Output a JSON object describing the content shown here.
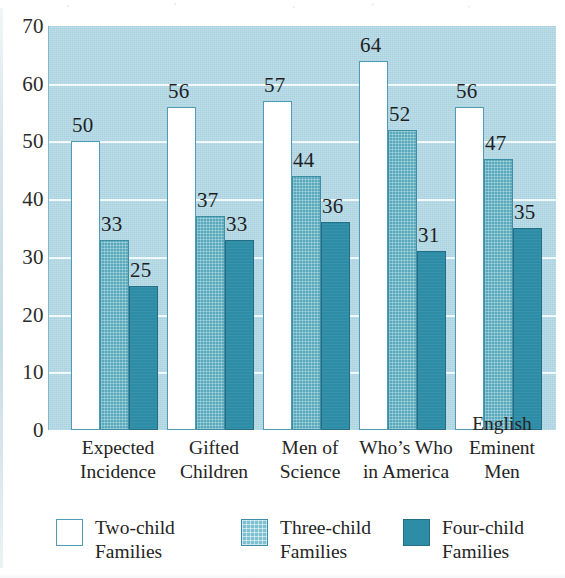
{
  "chart_data": {
    "type": "bar",
    "title": "",
    "subtitle": "",
    "xlabel": "",
    "ylabel": "",
    "ylim": [
      0,
      70
    ],
    "yticks": [
      0,
      10,
      20,
      30,
      40,
      50,
      60,
      70
    ],
    "grid": true,
    "legend_position": "bottom",
    "categories": [
      "Expected\nIncidence",
      "Gifted\nChildren",
      "Men of\nScience",
      "Who's Who\nin America",
      "English\nEminent\nMen"
    ],
    "category_lines": [
      [
        "Expected",
        "Incidence"
      ],
      [
        "Gifted",
        "Children"
      ],
      [
        "Men of",
        "Science"
      ],
      [
        "Who’s Who",
        "in America"
      ],
      [
        "English",
        "Eminent",
        "Men"
      ]
    ],
    "series": [
      {
        "name": "Two-child Families",
        "values": [
          50,
          56,
          57,
          64,
          56
        ]
      },
      {
        "name": "Three-child Families",
        "values": [
          33,
          37,
          44,
          52,
          47
        ]
      },
      {
        "name": "Four-child Families",
        "values": [
          25,
          33,
          36,
          31,
          35
        ]
      }
    ]
  },
  "legend": {
    "items": [
      {
        "label_line1": "Two-child",
        "label_line2": "Families",
        "swatch": "two"
      },
      {
        "label_line1": "Three-child",
        "label_line2": "Families",
        "swatch": "three"
      },
      {
        "label_line1": "Four-child",
        "label_line2": "Families",
        "swatch": "four"
      }
    ]
  },
  "colors": {
    "plot_background": "#a8d2e0",
    "gridline": "#f4fbfd",
    "two_child_fill": "#ffffff",
    "two_child_stroke": "#4e9cb3",
    "three_child_fill": "#59a9bd",
    "four_child_fill": "#2d8ca6",
    "text": "#242424"
  }
}
